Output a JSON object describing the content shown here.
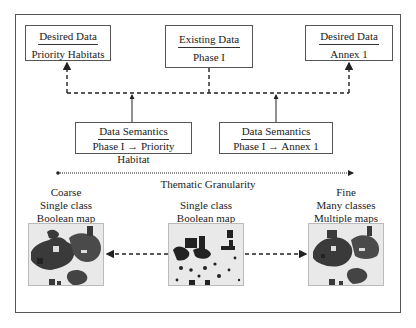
{
  "diagram": {
    "top_boxes": [
      {
        "title": "Desired Data",
        "subtitle": "Priority Habitats"
      },
      {
        "title": "Existing Data",
        "subtitle": "Phase I"
      },
      {
        "title": "Desired Data",
        "subtitle": "Annex 1"
      }
    ],
    "semantic_boxes": [
      {
        "title": "Data Semantics",
        "subtitle": "Phase I → Priority Habitat"
      },
      {
        "title": "Data Semantics",
        "subtitle": "Phase I → Annex 1"
      }
    ],
    "axis_label": "Thematic Granularity",
    "maps": [
      {
        "lines": [
          "Coarse",
          "Single class",
          "Boolean map"
        ],
        "density": "high"
      },
      {
        "lines": [
          "Single class",
          "Boolean map"
        ],
        "density": "sparse"
      },
      {
        "lines": [
          "Fine",
          "Many classes",
          "Multiple maps"
        ],
        "density": "high"
      }
    ]
  }
}
